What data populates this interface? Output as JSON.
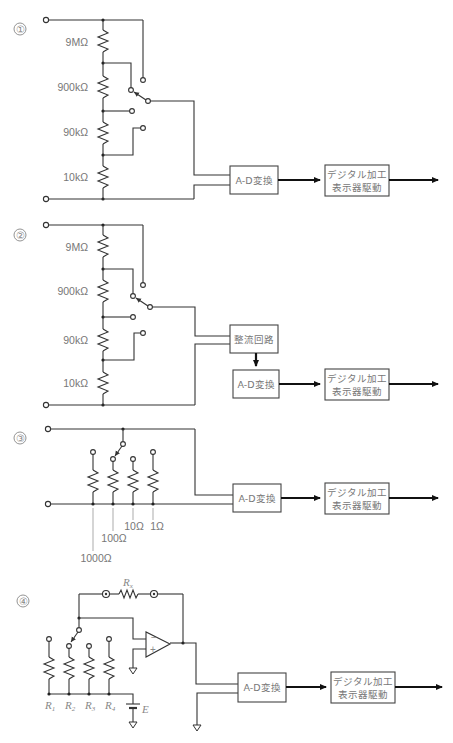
{
  "figure": {
    "colors": {
      "wire": "#333333",
      "label": "#777777",
      "arrow": "#111111"
    }
  },
  "circuits": [
    {
      "number": "①",
      "resistors": [
        "9MΩ",
        "900kΩ",
        "90kΩ",
        "10kΩ"
      ],
      "blocks": {
        "adc": "A-D変換",
        "digital_line1": "デジタル加工",
        "digital_line2": "表示器駆動"
      }
    },
    {
      "number": "②",
      "resistors": [
        "9MΩ",
        "900kΩ",
        "90kΩ",
        "10kΩ"
      ],
      "blocks": {
        "rectifier": "整流回路",
        "adc": "A-D変換",
        "digital_line1": "デジタル加工",
        "digital_line2": "表示器駆動"
      }
    },
    {
      "number": "③",
      "shunts": [
        "1000Ω",
        "100Ω",
        "10Ω",
        "1Ω"
      ],
      "blocks": {
        "adc": "A-D変換",
        "digital_line1": "デジタル加工",
        "digital_line2": "表示器駆動"
      }
    },
    {
      "number": "④",
      "unknown_resistor": "R",
      "unknown_resistor_sub": "x",
      "resistors": [
        {
          "name": "R",
          "sub": "1"
        },
        {
          "name": "R",
          "sub": "2"
        },
        {
          "name": "R",
          "sub": "3"
        },
        {
          "name": "R",
          "sub": "4"
        }
      ],
      "source": "E",
      "opamp_inputs": [
        "−",
        "+"
      ],
      "blocks": {
        "adc": "A-D変換",
        "digital_line1": "デジタル加工",
        "digital_line2": "表示器駆動"
      }
    }
  ]
}
